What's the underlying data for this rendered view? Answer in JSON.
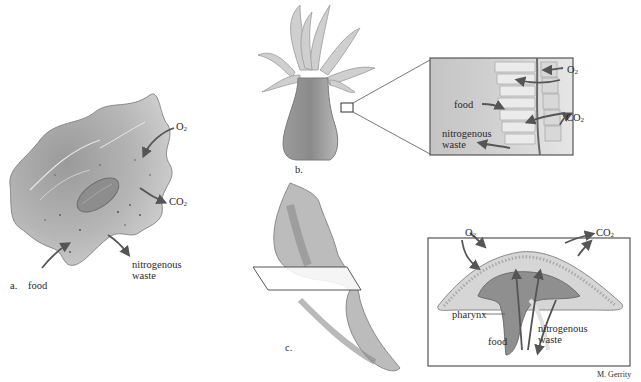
{
  "figure": {
    "panel_a": {
      "letter": "a.",
      "labels": {
        "o2": "O",
        "o2_sub": "2",
        "co2": "CO",
        "co2_sub": "2",
        "food": "food",
        "nitro_1": "nitrogenous",
        "nitro_2": "waste"
      }
    },
    "panel_b": {
      "letter": "b.",
      "labels": {
        "o2": "O",
        "o2_sub": "2",
        "co2": "CO",
        "co2_sub": "2",
        "food": "food",
        "nitro_1": "nitrogenous",
        "nitro_2": "waste"
      }
    },
    "panel_c": {
      "letter": "c.",
      "labels": {
        "o2": "O",
        "o2_sub": "2",
        "co2": "CO",
        "co2_sub": "2",
        "pharynx": "pharynx",
        "food": "food",
        "nitro_1": "nitrogenous",
        "nitro_2": "waste"
      }
    },
    "credit": "M. Gerrity"
  }
}
